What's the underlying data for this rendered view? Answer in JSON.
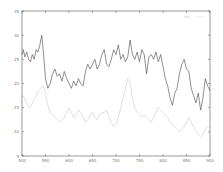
{
  "chart_data": {
    "type": "line",
    "title": "",
    "xlabel": "",
    "ylabel": "",
    "xlim": [
      500,
      900
    ],
    "ylim": [
      5,
      35
    ],
    "grid": false,
    "legend_position": "upper right",
    "x_ticks": [
      500,
      550,
      600,
      650,
      700,
      750,
      800,
      850,
      900
    ],
    "y_ticks": [
      5,
      10,
      15,
      20,
      25,
      30,
      35
    ],
    "series": [
      {
        "name": "",
        "color": "#444444",
        "x": [
          500,
          503,
          506,
          510,
          514,
          518,
          522,
          526,
          530,
          534,
          538,
          542,
          546,
          550,
          555,
          560,
          565,
          570,
          575,
          580,
          585,
          590,
          595,
          600,
          605,
          610,
          615,
          620,
          625,
          630,
          635,
          640,
          645,
          650,
          655,
          660,
          665,
          670,
          675,
          680,
          685,
          690,
          695,
          700,
          705,
          710,
          715,
          720,
          725,
          730,
          735,
          740,
          745,
          750,
          755,
          760,
          765,
          770,
          775,
          780,
          785,
          790,
          795,
          800,
          805,
          810,
          815,
          820,
          825,
          830,
          835,
          840,
          845,
          850,
          855,
          860,
          865,
          870,
          875,
          880,
          885,
          890,
          895,
          900
        ],
        "values": [
          26,
          27,
          25.5,
          26.5,
          25,
          24.5,
          26,
          25,
          27,
          26.5,
          28,
          30,
          26,
          21,
          19,
          20,
          22,
          23,
          21.5,
          22,
          20.5,
          22.5,
          21,
          20,
          19,
          20.5,
          19.5,
          21,
          20,
          19.5,
          22.5,
          24,
          23,
          24,
          25,
          23,
          24,
          26,
          27,
          24,
          23.5,
          25,
          27,
          26,
          28,
          25,
          26,
          24.5,
          25.5,
          29,
          26,
          25,
          26.5,
          24.5,
          27,
          26,
          22,
          25.5,
          26,
          25,
          26.5,
          24.5,
          26,
          23.5,
          21,
          19.5,
          17,
          15.5,
          18,
          19,
          22,
          24,
          25,
          23,
          22.5,
          19,
          17.5,
          16,
          18,
          14.5,
          17,
          21,
          19.5,
          18.5
        ]
      },
      {
        "name": "",
        "color": "#c8c8c8",
        "x": [
          500,
          505,
          510,
          515,
          520,
          525,
          530,
          535,
          540,
          545,
          550,
          555,
          560,
          565,
          570,
          575,
          580,
          585,
          590,
          595,
          600,
          605,
          610,
          615,
          620,
          625,
          630,
          635,
          640,
          645,
          650,
          655,
          660,
          665,
          670,
          675,
          680,
          685,
          690,
          695,
          700,
          705,
          710,
          715,
          720,
          725,
          730,
          735,
          740,
          745,
          750,
          755,
          760,
          765,
          770,
          775,
          780,
          785,
          790,
          795,
          800,
          805,
          810,
          815,
          820,
          825,
          830,
          835,
          840,
          845,
          850,
          855,
          860,
          865,
          870,
          875,
          880,
          885,
          890,
          895,
          900
        ],
        "values": [
          18,
          17,
          16,
          15,
          15.5,
          16.5,
          17.5,
          18.5,
          19,
          19.5,
          18,
          15.5,
          14,
          13.5,
          13,
          12.5,
          12,
          12.5,
          13,
          14,
          15,
          14,
          13,
          13.5,
          14.5,
          14,
          13,
          12,
          12.5,
          13.5,
          14,
          13,
          12.5,
          13.5,
          14,
          14,
          14.5,
          13,
          12,
          11,
          11.5,
          13,
          15,
          17,
          19,
          21,
          20,
          17,
          15,
          14,
          13.5,
          13,
          13.5,
          13,
          12.5,
          12,
          13,
          14,
          15,
          14.5,
          14,
          13.5,
          13,
          12,
          11.5,
          11,
          10.5,
          10,
          10.5,
          11,
          12,
          13,
          12,
          11,
          10,
          9.5,
          9,
          9.5,
          10.5,
          11,
          11
        ]
      }
    ]
  }
}
